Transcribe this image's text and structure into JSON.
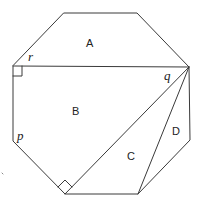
{
  "diagram": {
    "type": "regular-octagon-dissection",
    "stroke_color": "#3a3a3a",
    "background": "#ffffff",
    "octagon_vertices": [
      [
        64,
        13
      ],
      [
        137,
        13
      ],
      [
        189,
        67
      ],
      [
        190,
        140
      ],
      [
        138,
        194
      ],
      [
        65,
        194
      ],
      [
        13,
        141
      ],
      [
        13,
        66
      ]
    ],
    "chords": [
      {
        "name": "horizontal-chord",
        "from": [
          13,
          66
        ],
        "to": [
          189,
          67
        ]
      },
      {
        "name": "diagonal-to-bottom-left",
        "from": [
          189,
          67
        ],
        "to": [
          65,
          194
        ]
      },
      {
        "name": "diagonal-to-bottom-right",
        "from": [
          189,
          67
        ],
        "to": [
          138,
          194
        ]
      }
    ],
    "right_angle_markers": [
      {
        "name": "right-angle-upper-left",
        "at": [
          13,
          66
        ]
      },
      {
        "name": "right-angle-bottom",
        "at": [
          65,
          194
        ]
      }
    ],
    "region_labels": {
      "A": "A",
      "B": "B",
      "C": "C",
      "D": "D"
    },
    "angle_labels": {
      "p": "p",
      "q": "q",
      "r": "r"
    }
  }
}
